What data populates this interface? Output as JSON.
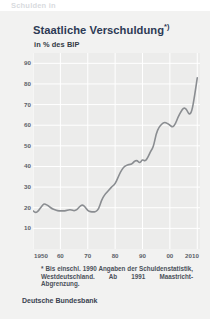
{
  "top_cutoff_text": "Schulden in",
  "panel": {
    "title": "Staatliche Verschuldung",
    "title_superscript": "*)",
    "subtitle": "in % des BIP",
    "footnote": "* Bis einschl. 1990 Angaben der Schuldenstatistik, Westdeutschland. Ab 1991 Maastricht-Abgrenzung.",
    "source": "Deutsche Bundesbank"
  },
  "colors": {
    "title": "#2d3a55",
    "line": "#8a8d91",
    "panel_bg": "#f2f2f1",
    "plot_bg": "#ececeb",
    "grid": "#ffffff",
    "tick_text": "#5a5f68"
  },
  "chart_data": {
    "type": "line",
    "title": "Staatliche Verschuldung*)",
    "xlabel": "",
    "ylabel": "in % des BIP",
    "xlim": [
      1950,
      2011
    ],
    "ylim": [
      0,
      95
    ],
    "grid": true,
    "legend": false,
    "ytick_labels": [
      "90",
      "80",
      "70",
      "60",
      "50",
      "40",
      "30",
      "20",
      "10"
    ],
    "ytick_values": [
      90,
      80,
      70,
      60,
      50,
      40,
      30,
      20,
      10
    ],
    "xtick_labels": [
      "1950",
      "60",
      "70",
      "80",
      "90",
      "00",
      "2010"
    ],
    "xtick_values": [
      1950,
      1960,
      1970,
      1980,
      1990,
      2000,
      2010
    ],
    "series": [
      {
        "name": "Staatliche Verschuldung in % des BIP",
        "x": [
          1950,
          1951,
          1952,
          1953,
          1954,
          1955,
          1956,
          1957,
          1958,
          1959,
          1960,
          1961,
          1962,
          1963,
          1964,
          1965,
          1966,
          1967,
          1968,
          1969,
          1970,
          1971,
          1972,
          1973,
          1974,
          1975,
          1976,
          1977,
          1978,
          1979,
          1980,
          1981,
          1982,
          1983,
          1984,
          1985,
          1986,
          1987,
          1988,
          1989,
          1990,
          1991,
          1992,
          1993,
          1994,
          1995,
          1996,
          1997,
          1998,
          1999,
          2000,
          2001,
          2002,
          2003,
          2004,
          2005,
          2006,
          2007,
          2008,
          2009,
          2010
        ],
        "values": [
          18.5,
          17.5,
          18.5,
          20.5,
          22.0,
          21.5,
          20.5,
          19.5,
          19.0,
          18.5,
          18.5,
          18.5,
          18.5,
          19.0,
          19.0,
          18.5,
          19.0,
          20.5,
          21.5,
          20.5,
          18.5,
          18.0,
          18.0,
          18.0,
          19.5,
          23.5,
          26.0,
          27.5,
          29.0,
          30.5,
          31.5,
          34.5,
          37.5,
          39.5,
          40.5,
          41.0,
          41.0,
          42.5,
          43.0,
          41.5,
          43.5,
          42.5,
          44.5,
          47.5,
          49.5,
          56.0,
          59.0,
          60.5,
          61.5,
          61.0,
          60.0,
          59.0,
          60.5,
          64.0,
          66.5,
          68.5,
          68.0,
          65.0,
          66.5,
          74.0,
          83.0
        ]
      }
    ]
  }
}
